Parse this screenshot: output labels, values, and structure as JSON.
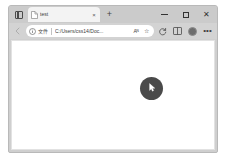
{
  "browser": {
    "name": "edge-browser-window",
    "tab_strip": {
      "vertical_tabs_label": "vertical-tabs-toggle",
      "tabs": [
        {
          "title": "test",
          "favicon": "document-icon",
          "close_label": "×"
        }
      ],
      "new_tab_label": "+"
    },
    "window_controls": {
      "minimize_label": "–",
      "maximize_label": "□",
      "close_label": "✕"
    },
    "toolbar": {
      "back_label": "back-arrow-icon",
      "omnibox": {
        "info_icon": "info-circle-icon",
        "scheme_label": "文件",
        "url": "C:/Users/css14/Doc...",
        "read_aloud_label": "Aᴺ",
        "favorite_label": "☆"
      },
      "actions": [
        {
          "name": "collections-icon",
          "label": ""
        },
        {
          "name": "split-screen-icon",
          "label": ""
        },
        {
          "name": "profile-avatar",
          "label": ""
        },
        {
          "name": "settings-more-icon",
          "label": "•••"
        }
      ]
    },
    "page": {
      "cursor_marker": "mouse-cursor-highlight",
      "marker_color": "#4a4a4a"
    }
  }
}
